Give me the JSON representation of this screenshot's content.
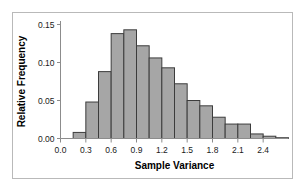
{
  "chart_data": {
    "type": "bar",
    "title": "",
    "xlabel": "Sample Variance",
    "ylabel": "Relative Frequency",
    "xlim": [
      0.0,
      2.7
    ],
    "ylim": [
      0.0,
      0.15
    ],
    "grid": false,
    "legend": null,
    "bin_width": 0.15,
    "xticks": [
      "0.0",
      "0.3",
      "0.6",
      "0.9",
      "1.2",
      "1.5",
      "1.8",
      "2.1",
      "2.4"
    ],
    "xtick_values": [
      0.0,
      0.3,
      0.6,
      0.9,
      1.2,
      1.5,
      1.8,
      2.1,
      2.4
    ],
    "yticks": [
      "0.00",
      "0.05",
      "0.10",
      "0.15"
    ],
    "ytick_values": [
      0.0,
      0.05,
      0.1,
      0.15
    ],
    "bin_edges": [
      0.15,
      0.3,
      0.45,
      0.6,
      0.75,
      0.9,
      1.05,
      1.2,
      1.35,
      1.5,
      1.65,
      1.8,
      1.95,
      2.1,
      2.25,
      2.4,
      2.55,
      2.7
    ],
    "categories": [
      "0.15-0.30",
      "0.30-0.45",
      "0.45-0.60",
      "0.60-0.75",
      "0.75-0.90",
      "0.90-1.05",
      "1.05-1.20",
      "1.20-1.35",
      "1.35-1.50",
      "1.50-1.65",
      "1.65-1.80",
      "1.80-1.95",
      "1.95-2.10",
      "2.10-2.25",
      "2.25-2.40",
      "2.40-2.55",
      "2.55-2.70"
    ],
    "values": [
      0.008,
      0.048,
      0.088,
      0.138,
      0.143,
      0.122,
      0.106,
      0.093,
      0.072,
      0.05,
      0.043,
      0.028,
      0.019,
      0.019,
      0.006,
      0.003,
      0.001
    ],
    "bar_fill_color": "#a6a6a6",
    "bar_edge_color": "#3c3c3c",
    "axis_color": "#8c8c8c",
    "frame_color": "#b9b9b9",
    "background_color": "#ffffff"
  }
}
